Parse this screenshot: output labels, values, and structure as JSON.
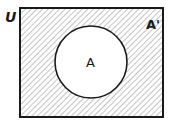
{
  "diagram": {
    "type": "venn",
    "universe_label": "U",
    "set_label": "A",
    "complement_label": "A'",
    "shaded_region": "complement of A",
    "colors": {
      "stroke": "#1a1a1a",
      "hatch": "#8a8a8a",
      "background": "#ffffff"
    }
  }
}
